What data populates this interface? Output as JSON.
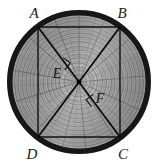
{
  "figure": {
    "name": "inscribed-rectangle-in-tree-cross-section",
    "canvas": {
      "width": 160,
      "height": 166,
      "background": "#ffffff"
    },
    "circle": {
      "label": "tree-cross-section",
      "center_x": 79,
      "center_y": 82,
      "outer_radius": 72,
      "bark_thickness": 6,
      "bark_color": "#161616",
      "wood_color": "#a8a8a8",
      "ring_color": "#7a7a7a",
      "growth_rings": 16
    },
    "rectangle": {
      "stroke_color": "#111111",
      "stroke_width": 1.4,
      "corners": [
        {
          "id": "A",
          "x": 38,
          "y": 27
        },
        {
          "id": "B",
          "x": 120,
          "y": 27
        },
        {
          "id": "C",
          "x": 120,
          "y": 137
        },
        {
          "id": "D",
          "x": 38,
          "y": 137
        }
      ]
    },
    "diagonals": [
      {
        "id": "AC",
        "from": "A",
        "from_x": 38,
        "from_y": 27,
        "to": "C",
        "to_x": 120,
        "to_y": 137
      },
      {
        "id": "DB",
        "from": "D",
        "from_x": 38,
        "from_y": 137,
        "to": "B",
        "to_x": 120,
        "to_y": 27
      }
    ],
    "center_point": {
      "x": 79,
      "y": 82,
      "color": "#000000",
      "radius": 2.4
    },
    "right_angle_marks": [
      {
        "near": "E",
        "x": 66,
        "y": 62
      },
      {
        "near": "F",
        "x": 92,
        "y": 102
      }
    ],
    "labels": [
      {
        "id": "label-A",
        "text": "A",
        "x": 34,
        "y": 18,
        "kind": "vertex"
      },
      {
        "id": "label-B",
        "text": "B",
        "x": 120,
        "y": 18,
        "kind": "vertex"
      },
      {
        "id": "label-C",
        "text": "C",
        "x": 121,
        "y": 158,
        "kind": "vertex"
      },
      {
        "id": "label-D",
        "text": "D",
        "x": 31,
        "y": 158,
        "kind": "vertex"
      },
      {
        "id": "label-E",
        "text": "E",
        "x": 57,
        "y": 74,
        "kind": "interior"
      },
      {
        "id": "label-F",
        "text": "F",
        "x": 96,
        "y": 101,
        "kind": "interior"
      }
    ]
  },
  "text": {
    "A": "A",
    "B": "B",
    "C": "C",
    "D": "D",
    "E": "E",
    "F": "F"
  }
}
